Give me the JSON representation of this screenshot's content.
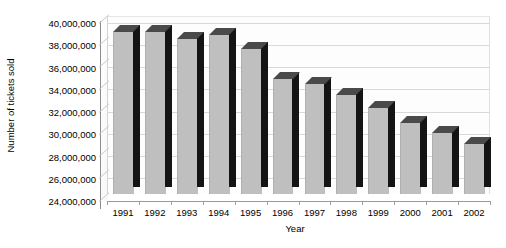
{
  "chart_data": {
    "type": "bar",
    "title": "",
    "xlabel": "Year",
    "ylabel": "Number of tickets sold",
    "categories": [
      "1991",
      "1992",
      "1993",
      "1994",
      "1995",
      "1996",
      "1997",
      "1998",
      "1999",
      "2000",
      "2001",
      "2002"
    ],
    "values": [
      38600000,
      38600000,
      37900000,
      38300000,
      37000000,
      34300000,
      33900000,
      32900000,
      31700000,
      30400000,
      29500000,
      28500000
    ],
    "ylim": [
      24000000,
      40000000
    ],
    "ytick_step": 2000000,
    "ytick_labels": [
      "40,000,000",
      "38,000,000",
      "36,000,000",
      "34,000,000",
      "32,000,000",
      "30,000,000",
      "28,000,000",
      "26,000,000",
      "24,000,000"
    ],
    "ytick_values": [
      40000000,
      38000000,
      36000000,
      34000000,
      32000000,
      30000000,
      28000000,
      26000000,
      24000000
    ],
    "grid": true,
    "legend": "none",
    "style": "3d-column",
    "colors": {
      "bar_face": "#bfbfbf",
      "bar_side": "#141414",
      "bar_top": "#4a4a4a",
      "gridline": "#d9d9d9",
      "axis": "#8c8c8c",
      "text": "#000000",
      "background": "#ffffff"
    }
  }
}
